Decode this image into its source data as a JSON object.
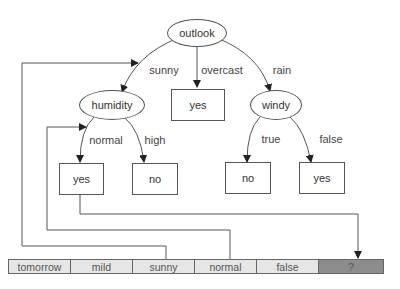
{
  "tree": {
    "root": {
      "label": "outlook"
    },
    "branches": {
      "sunny": "sunny",
      "overcast": "overcast",
      "rain": "rain",
      "normal": "normal",
      "high": "high",
      "true": "true",
      "false": "false"
    },
    "nodes": {
      "humidity": "humidity",
      "windy": "windy"
    },
    "leaves": {
      "overcast_yes": "yes",
      "humidity_normal_yes": "yes",
      "humidity_high_no": "no",
      "windy_true_no": "no",
      "windy_false_yes": "yes"
    }
  },
  "instance": {
    "cells": [
      "tomorrow",
      "mild",
      "sunny",
      "normal",
      "false",
      "?"
    ]
  },
  "colors": {
    "line": "#555555",
    "cell_bg": "#e6e6e6",
    "query_bg": "#8c8c8c"
  }
}
